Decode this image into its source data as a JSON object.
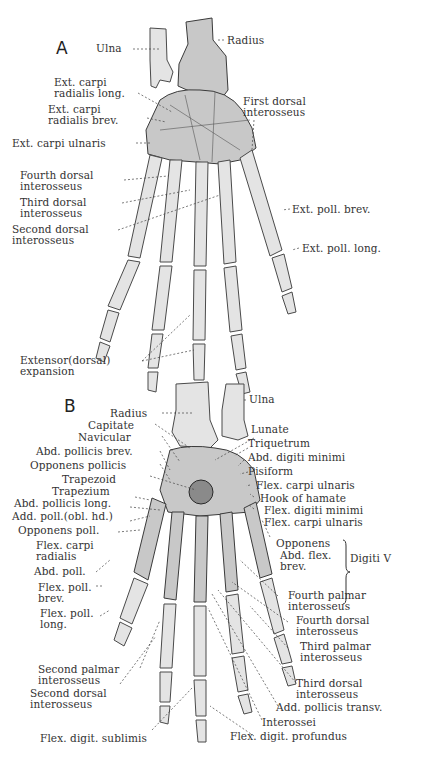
{
  "figure": {
    "panels": [
      {
        "id": "A",
        "letter": "A",
        "view": "dorsal",
        "labels": [
          {
            "key": "ulna",
            "text": "Ulna"
          },
          {
            "key": "radius",
            "text": "Radius"
          },
          {
            "key": "ext_carpi_rad_long",
            "text": "Ext. carpi\nradialis long."
          },
          {
            "key": "ext_carpi_rad_brev",
            "text": "Ext. carpi\nradialis brev."
          },
          {
            "key": "first_dorsal_int",
            "text": "First dorsal\ninterosseus"
          },
          {
            "key": "ext_carpi_uln",
            "text": "Ext. carpi ulnaris"
          },
          {
            "key": "fourth_dorsal_int",
            "text": "Fourth dorsal\ninterosseus"
          },
          {
            "key": "third_dorsal_int",
            "text": "Third dorsal\ninterosseus"
          },
          {
            "key": "second_dorsal_int",
            "text": "Second dorsal\ninterosseus"
          },
          {
            "key": "ext_poll_brev",
            "text": "Ext. poll. brev."
          },
          {
            "key": "ext_poll_long",
            "text": "Ext. poll. long."
          },
          {
            "key": "extensor_expansion",
            "text": "Extensor(dorsal)\nexpansion"
          }
        ]
      },
      {
        "id": "B",
        "letter": "B",
        "view": "palmar",
        "labels": [
          {
            "key": "ulna",
            "text": "Ulna"
          },
          {
            "key": "radius",
            "text": "Radius"
          },
          {
            "key": "capitate",
            "text": "Capitate"
          },
          {
            "key": "navicular",
            "text": "Navicular"
          },
          {
            "key": "lunate",
            "text": "Lunate"
          },
          {
            "key": "triquetrum",
            "text": "Triquetrum"
          },
          {
            "key": "abd_poll_brev",
            "text": "Abd. pollicis brev."
          },
          {
            "key": "abd_dig_min",
            "text": "Abd. digiti minimi"
          },
          {
            "key": "opponens_pollicis",
            "text": "Opponens pollicis"
          },
          {
            "key": "pisiform",
            "text": "Pisiform"
          },
          {
            "key": "trapezoid",
            "text": "Trapezoid"
          },
          {
            "key": "flex_carpi_uln_1",
            "text": "Flex. carpi ulnaris"
          },
          {
            "key": "trapezium",
            "text": "Trapezium"
          },
          {
            "key": "hook_hamate",
            "text": "Hook of hamate"
          },
          {
            "key": "abd_poll_long",
            "text": "Abd. pollicis long."
          },
          {
            "key": "flex_dig_min",
            "text": "Flex. digiti minimi"
          },
          {
            "key": "add_poll_obl",
            "text": "Add. poll.(obl. hd.)"
          },
          {
            "key": "flex_carpi_uln_2",
            "text": "Flex. carpi ulnaris"
          },
          {
            "key": "opponens_poll",
            "text": "Opponens poll."
          },
          {
            "key": "flex_carpi_rad",
            "text": "Flex. carpi\nradialis"
          },
          {
            "key": "opponens_v",
            "text": "Opponens"
          },
          {
            "key": "abd_flex_brev_v",
            "text": "Abd. flex.\nbrev."
          },
          {
            "key": "digiti_v",
            "text": "Digiti V"
          },
          {
            "key": "abd_poll",
            "text": "Abd. poll."
          },
          {
            "key": "flex_poll_brev",
            "text": "Flex. poll.\nbrev."
          },
          {
            "key": "flex_poll_long",
            "text": "Flex. poll.\nlong."
          },
          {
            "key": "fourth_palmar_int",
            "text": "Fourth palmar\ninterosseus"
          },
          {
            "key": "fourth_dorsal_int",
            "text": "Fourth dorsal\ninterosseus"
          },
          {
            "key": "third_palmar_int",
            "text": "Third palmar\ninterosseus"
          },
          {
            "key": "second_palmar_int",
            "text": "Second palmar\ninterosseus"
          },
          {
            "key": "third_dorsal_int",
            "text": "Third dorsal\ninterosseus"
          },
          {
            "key": "second_dorsal_int",
            "text": "Second dorsal\ninterosseus"
          },
          {
            "key": "add_poll_transv",
            "text": "Add. pollicis transv."
          },
          {
            "key": "interossei",
            "text": "Interossei"
          },
          {
            "key": "flex_dig_sublimis",
            "text": "Flex. digit. sublimis"
          },
          {
            "key": "flex_dig_profundus",
            "text": "Flex. digit. profundus"
          }
        ]
      }
    ]
  },
  "colors": {
    "background": "#ffffff",
    "bone_light": "#e4e4e4",
    "bone_mid": "#c8c8c8",
    "bone_dark": "#8a8a8a",
    "outline": "#3a3a3a",
    "text": "#333333"
  }
}
